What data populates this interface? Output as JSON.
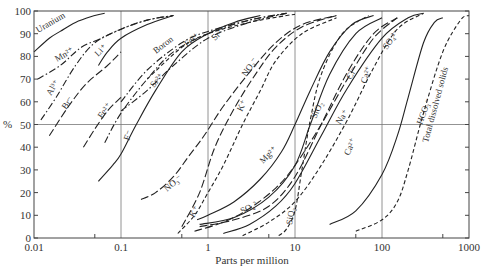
{
  "chart_data": {
    "type": "line",
    "title": "",
    "xlabel": "Parts per million",
    "ylabel": "%",
    "xscale": "log",
    "xlim": [
      0.01,
      1000
    ],
    "ylim": [
      0,
      100
    ],
    "x_ticks": [
      "0.01",
      "0.1",
      "1",
      "10",
      "100",
      "1000"
    ],
    "y_ticks": [
      "0",
      "10",
      "20",
      "30",
      "40",
      "50",
      "60",
      "70",
      "80",
      "90",
      "100"
    ],
    "grid": {
      "vertical_at": [
        0.1,
        1,
        10,
        100
      ],
      "horizontal_at": [
        50
      ]
    },
    "legend": "none (curves labeled inline)",
    "series": [
      {
        "name": "Uranium",
        "style": "solid",
        "points": [
          [
            0.01,
            82
          ],
          [
            0.015,
            88
          ],
          [
            0.02,
            91
          ],
          [
            0.03,
            95
          ],
          [
            0.05,
            98
          ],
          [
            0.065,
            99
          ]
        ]
      },
      {
        "name": "Mn2+",
        "style": "dashdot",
        "points": [
          [
            0.011,
            70
          ],
          [
            0.02,
            76
          ],
          [
            0.035,
            84
          ],
          [
            0.06,
            88
          ],
          [
            0.1,
            92
          ],
          [
            0.2,
            96
          ],
          [
            0.4,
            98
          ]
        ]
      },
      {
        "name": "Al3+",
        "style": "dashdot",
        "points": [
          [
            0.012,
            52
          ],
          [
            0.018,
            62
          ],
          [
            0.03,
            76
          ],
          [
            0.05,
            86
          ],
          [
            0.1,
            92
          ],
          [
            0.2,
            96
          ],
          [
            0.4,
            98
          ]
        ]
      },
      {
        "name": "Br-",
        "style": "longdash",
        "points": [
          [
            0.015,
            45
          ],
          [
            0.025,
            58
          ],
          [
            0.04,
            68
          ],
          [
            0.07,
            76
          ],
          [
            0.1,
            82
          ]
        ]
      },
      {
        "name": "Li+",
        "style": "solid",
        "points": [
          [
            0.055,
            76
          ],
          [
            0.07,
            82
          ],
          [
            0.1,
            88
          ],
          [
            0.2,
            94
          ],
          [
            0.4,
            98
          ]
        ]
      },
      {
        "name": "Fe2+",
        "style": "longdash",
        "points": [
          [
            0.037,
            40
          ],
          [
            0.05,
            48
          ],
          [
            0.07,
            56
          ],
          [
            0.1,
            62
          ]
        ]
      },
      {
        "name": "F-",
        "style": "solid",
        "points": [
          [
            0.055,
            25
          ],
          [
            0.08,
            32
          ],
          [
            0.1,
            37
          ],
          [
            0.15,
            50
          ],
          [
            0.25,
            65
          ],
          [
            0.5,
            82
          ],
          [
            1,
            90
          ],
          [
            2,
            95
          ],
          [
            4,
            98
          ]
        ]
      },
      {
        "name": "Boron",
        "style": "dashdot",
        "points": [
          [
            0.065,
            42
          ],
          [
            0.1,
            55
          ],
          [
            0.2,
            70
          ],
          [
            0.4,
            82
          ],
          [
            1,
            90
          ],
          [
            3,
            96
          ],
          [
            8,
            99
          ]
        ]
      },
      {
        "name": "Sr2+",
        "style": "dashdot",
        "points": [
          [
            0.1,
            56
          ],
          [
            0.2,
            65
          ],
          [
            0.4,
            76
          ],
          [
            1,
            88
          ],
          [
            3,
            95
          ],
          [
            8,
            99
          ]
        ]
      },
      {
        "name": "Fe2+ (upper)",
        "style": "dashdot",
        "points": [
          [
            0.1,
            60
          ],
          [
            0.2,
            74
          ],
          [
            0.5,
            86
          ],
          [
            1,
            91
          ],
          [
            3,
            96
          ],
          [
            8,
            99
          ]
        ]
      },
      {
        "name": "SiO2 (upper)",
        "style": "dashed",
        "points": [
          [
            0.2,
            70
          ],
          [
            0.5,
            84
          ],
          [
            1,
            90
          ],
          [
            3,
            95
          ],
          [
            8,
            98
          ],
          [
            10,
            98.5
          ]
        ]
      },
      {
        "name": "NO3- (lower)",
        "style": "longdash",
        "points": [
          [
            0.17,
            17
          ],
          [
            0.25,
            20
          ],
          [
            0.4,
            27
          ],
          [
            0.6,
            36
          ],
          [
            0.9,
            45
          ],
          [
            1.5,
            58
          ],
          [
            3,
            73
          ],
          [
            6,
            86
          ],
          [
            12,
            94
          ],
          [
            30,
            98
          ]
        ]
      },
      {
        "name": "NO3- (upper)",
        "style": "longdash",
        "points": [
          [
            0.5,
            5
          ],
          [
            0.8,
            20
          ],
          [
            1.2,
            40
          ],
          [
            2,
            57
          ],
          [
            3.5,
            72
          ],
          [
            6,
            84
          ],
          [
            12,
            93
          ],
          [
            30,
            98
          ]
        ]
      },
      {
        "name": "K+",
        "style": "dashed",
        "points": [
          [
            0.45,
            2
          ],
          [
            0.7,
            10
          ],
          [
            1,
            20
          ],
          [
            1.5,
            32
          ],
          [
            2.5,
            50
          ],
          [
            4,
            65
          ],
          [
            6,
            78
          ],
          [
            12,
            90
          ],
          [
            30,
            97
          ]
        ]
      },
      {
        "name": "Mg2+",
        "style": "solid",
        "points": [
          [
            0.75,
            8
          ],
          [
            1,
            10
          ],
          [
            2,
            16
          ],
          [
            4,
            26
          ],
          [
            7,
            38
          ],
          [
            10,
            50
          ],
          [
            15,
            65
          ],
          [
            25,
            82
          ],
          [
            45,
            94
          ],
          [
            80,
            98
          ]
        ]
      },
      {
        "name": "SiO2",
        "style": "solid",
        "points": [
          [
            0.8,
            6
          ],
          [
            2,
            9
          ],
          [
            5,
            18
          ],
          [
            10,
            32
          ],
          [
            15,
            50
          ],
          [
            25,
            72
          ],
          [
            50,
            90
          ],
          [
            100,
            97
          ]
        ]
      },
      {
        "name": "SO4 2-",
        "style": "longdash",
        "points": [
          [
            0.7,
            3
          ],
          [
            1.5,
            7
          ],
          [
            3,
            13
          ],
          [
            6,
            22
          ],
          [
            10,
            32
          ],
          [
            20,
            50
          ],
          [
            40,
            70
          ],
          [
            80,
            88
          ],
          [
            150,
            97
          ]
        ]
      },
      {
        "name": "Cl-",
        "style": "longdash",
        "points": [
          [
            0.8,
            5
          ],
          [
            2,
            8
          ],
          [
            5,
            14
          ],
          [
            10,
            27
          ],
          [
            20,
            50
          ],
          [
            40,
            73
          ],
          [
            80,
            90
          ],
          [
            150,
            97
          ]
        ]
      },
      {
        "name": "Na+",
        "style": "solid",
        "points": [
          [
            1.5,
            2
          ],
          [
            3,
            6
          ],
          [
            6,
            14
          ],
          [
            10,
            24
          ],
          [
            20,
            45
          ],
          [
            40,
            66
          ],
          [
            100,
            88
          ],
          [
            200,
            97
          ],
          [
            300,
            99
          ]
        ]
      },
      {
        "name": "Ca2+",
        "style": "dashed",
        "points": [
          [
            2.5,
            1
          ],
          [
            5,
            7
          ],
          [
            10,
            16
          ],
          [
            20,
            32
          ],
          [
            40,
            52
          ],
          [
            80,
            75
          ],
          [
            150,
            92
          ],
          [
            300,
            99
          ]
        ]
      },
      {
        "name": "SiO2 (steep)",
        "style": "dashed",
        "points": [
          [
            6.5,
            1
          ],
          [
            8,
            4
          ],
          [
            10,
            12
          ],
          [
            12,
            30
          ],
          [
            15,
            52
          ],
          [
            20,
            72
          ],
          [
            35,
            90
          ],
          [
            70,
            98
          ]
        ]
      },
      {
        "name": "HCO3-",
        "style": "solid",
        "points": [
          [
            25,
            6
          ],
          [
            50,
            12
          ],
          [
            100,
            28
          ],
          [
            150,
            45
          ],
          [
            200,
            62
          ],
          [
            300,
            86
          ],
          [
            400,
            95
          ],
          [
            500,
            97
          ]
        ]
      },
      {
        "name": "Total dissolved solids",
        "style": "dashed",
        "points": [
          [
            50,
            3
          ],
          [
            100,
            8
          ],
          [
            150,
            16
          ],
          [
            200,
            30
          ],
          [
            300,
            55
          ],
          [
            500,
            82
          ],
          [
            800,
            96
          ],
          [
            1000,
            98
          ]
        ]
      }
    ]
  },
  "labels": {
    "xlabel": "Parts per million",
    "ylabel": "%",
    "x_ticks": [
      "0.01",
      "0.1",
      "1",
      "10",
      "100",
      "1000"
    ],
    "y_ticks": [
      "0",
      "10",
      "20",
      "30",
      "40",
      "50",
      "60",
      "70",
      "80",
      "90",
      "100"
    ],
    "curve_labels": {
      "uranium": "Uranium",
      "mn": "Mn²⁺",
      "li": "Li⁺",
      "boron": "Boron",
      "fe_top": "Fe²⁺",
      "si_top": "Sr²⁺",
      "al": "Al³⁺",
      "br": "Br⁻",
      "fe_mid": "Fe²⁺",
      "sr": "Sr²⁺",
      "f": "F⁻",
      "no3_top": "NO₃⁻",
      "k_top": "K⁺",
      "no3_bot": "NO₃⁻",
      "k_bot": "K⁺",
      "mg": "Mg²⁺",
      "so4_bot": "SO₄²⁻",
      "sio2_bot": "SiO₂",
      "sio2_mid": "SiO₂",
      "cl": "Cl⁻",
      "ca_top": "Ca²⁺",
      "so4_top": "SO₄²⁻",
      "na": "Na⁺",
      "ca_mid": "Ca²⁺",
      "hco3": "HCO₃⁻",
      "tds": "Total dissolved solids"
    }
  }
}
